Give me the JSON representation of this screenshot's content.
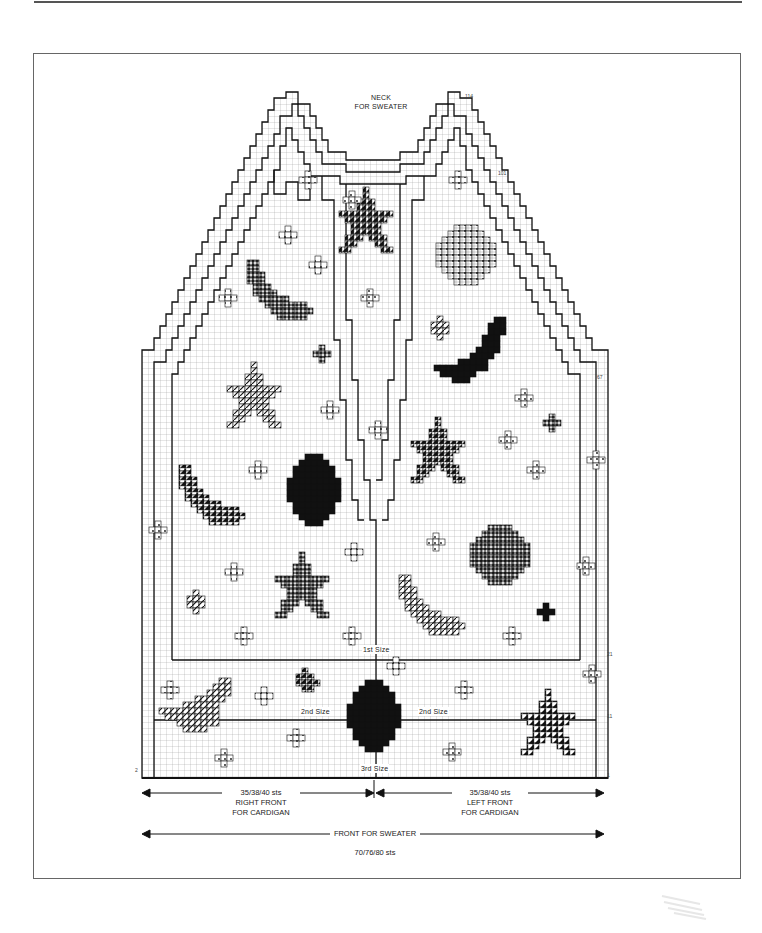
{
  "chart": {
    "title_neck": [
      "NECK",
      "FOR SWEATER"
    ],
    "row_numbers": {
      "r114": "114",
      "r101": "101",
      "r67": "67",
      "r21": "21",
      "r11": "11",
      "r1": "1",
      "r2": "2"
    },
    "size_labels": {
      "first": "1st Size",
      "second_left": "2nd Size",
      "second_right": "2nd Size",
      "third": "3rd Size"
    },
    "dimensions": {
      "right_front": [
        "35/38/40 sts",
        "RIGHT FRONT",
        "FOR CARDIGAN"
      ],
      "left_front": [
        "35/38/40 sts",
        "LEFT FRONT",
        "FOR CARDIGAN"
      ],
      "front_sweater": "FRONT FOR SWEATER",
      "front_sweater_sts": "70/76/80 sts"
    },
    "grid": {
      "origin_x": 142,
      "origin_y": 92,
      "cell": 6,
      "cols": 78,
      "rows": 115
    },
    "colors": {
      "ink": "#111111",
      "grid": "#9a9a9a",
      "frame": "#666666",
      "light_fill": "#d8d8d8"
    },
    "motif_legend": [
      {
        "key": "cross",
        "name": "small cross with dots"
      },
      {
        "key": "diag",
        "name": "diagonal hatched"
      },
      {
        "key": "tri",
        "name": "black triangle half-stitch"
      },
      {
        "key": "dots",
        "name": "dotted"
      },
      {
        "key": "solid",
        "name": "solid black"
      },
      {
        "key": "check",
        "name": "dense crosshatch"
      }
    ],
    "motifs": [
      {
        "type": "star",
        "fill": "tri",
        "x": 366,
        "y": 220,
        "s": 1.0
      },
      {
        "type": "circle",
        "fill": "dots",
        "x": 466,
        "y": 255,
        "s": 1.0
      },
      {
        "type": "moon_left",
        "fill": "check",
        "x": 280,
        "y": 290,
        "s": 1.0
      },
      {
        "type": "moon_right",
        "fill": "solid",
        "x": 470,
        "y": 350,
        "s": 1.0
      },
      {
        "type": "star",
        "fill": "diag",
        "x": 254,
        "y": 395,
        "s": 1.0
      },
      {
        "type": "star",
        "fill": "tri",
        "x": 438,
        "y": 450,
        "s": 1.0
      },
      {
        "type": "moon_left",
        "fill": "tri",
        "x": 212,
        "y": 495,
        "s": 1.0
      },
      {
        "type": "oval",
        "fill": "solid",
        "x": 314,
        "y": 490,
        "s": 1.0
      },
      {
        "type": "circle",
        "fill": "check",
        "x": 500,
        "y": 555,
        "s": 1.0
      },
      {
        "type": "star",
        "fill": "check",
        "x": 302,
        "y": 585,
        "s": 1.0
      },
      {
        "type": "moon_left",
        "fill": "diag",
        "x": 432,
        "y": 605,
        "s": 1.0
      },
      {
        "type": "moon_right_low",
        "fill": "diag",
        "x": 195,
        "y": 705,
        "s": 1.0
      },
      {
        "type": "oval",
        "fill": "solid",
        "x": 374,
        "y": 716,
        "s": 1.0
      },
      {
        "type": "star",
        "fill": "tri",
        "x": 548,
        "y": 722,
        "s": 1.0
      }
    ],
    "small_motifs": [
      {
        "fill": "cross",
        "x": 308,
        "y": 180
      },
      {
        "fill": "cross",
        "x": 352,
        "y": 200
      },
      {
        "fill": "cross",
        "x": 458,
        "y": 180
      },
      {
        "fill": "cross",
        "x": 288,
        "y": 235
      },
      {
        "fill": "cross",
        "x": 318,
        "y": 265
      },
      {
        "fill": "cross",
        "x": 228,
        "y": 298
      },
      {
        "fill": "cross",
        "x": 370,
        "y": 298
      },
      {
        "fill": "diag",
        "x": 440,
        "y": 328
      },
      {
        "fill": "check",
        "x": 322,
        "y": 354
      },
      {
        "fill": "cross",
        "x": 330,
        "y": 410
      },
      {
        "fill": "cross",
        "x": 378,
        "y": 430
      },
      {
        "fill": "cross",
        "x": 524,
        "y": 398
      },
      {
        "fill": "check",
        "x": 552,
        "y": 423
      },
      {
        "fill": "cross",
        "x": 508,
        "y": 440
      },
      {
        "fill": "cross",
        "x": 596,
        "y": 460
      },
      {
        "fill": "cross",
        "x": 536,
        "y": 470
      },
      {
        "fill": "cross",
        "x": 258,
        "y": 470
      },
      {
        "fill": "cross",
        "x": 158,
        "y": 530
      },
      {
        "fill": "cross",
        "x": 436,
        "y": 542
      },
      {
        "fill": "cross",
        "x": 354,
        "y": 552
      },
      {
        "fill": "cross",
        "x": 234,
        "y": 572
      },
      {
        "fill": "cross",
        "x": 586,
        "y": 566
      },
      {
        "fill": "diag",
        "x": 196,
        "y": 602
      },
      {
        "fill": "solid",
        "x": 546,
        "y": 612
      },
      {
        "fill": "cross",
        "x": 244,
        "y": 636
      },
      {
        "fill": "cross",
        "x": 352,
        "y": 636
      },
      {
        "fill": "cross",
        "x": 512,
        "y": 636
      },
      {
        "fill": "cross",
        "x": 396,
        "y": 666
      },
      {
        "fill": "tri",
        "x": 308,
        "y": 680
      },
      {
        "fill": "cross",
        "x": 170,
        "y": 690
      },
      {
        "fill": "cross",
        "x": 264,
        "y": 696
      },
      {
        "fill": "cross",
        "x": 464,
        "y": 690
      },
      {
        "fill": "cross",
        "x": 592,
        "y": 674
      },
      {
        "fill": "cross",
        "x": 296,
        "y": 738
      },
      {
        "fill": "cross",
        "x": 452,
        "y": 752
      },
      {
        "fill": "cross",
        "x": 224,
        "y": 758
      }
    ]
  }
}
